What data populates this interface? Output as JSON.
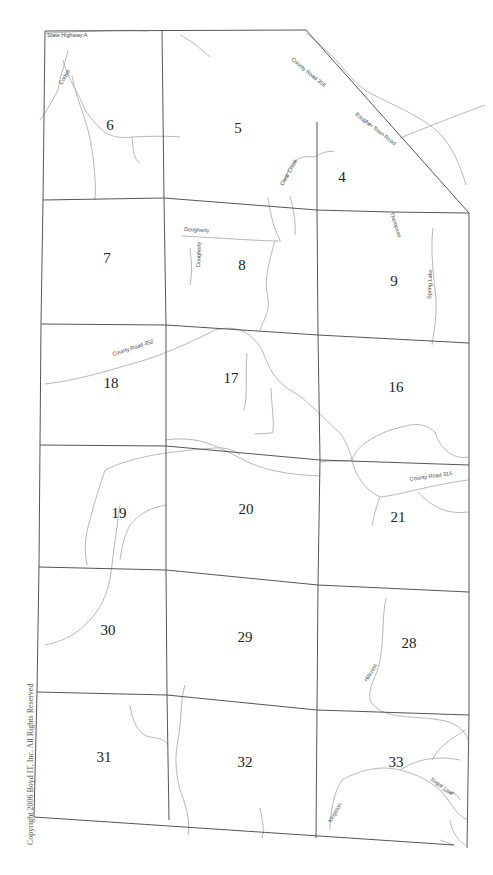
{
  "map": {
    "copyright": "Copyright 2006 Boyd IT, Inc. All Rights Reserved",
    "colors": {
      "grid": "#555555",
      "road": "#b8b8b8",
      "text": "#222222",
      "background": "#ffffff"
    },
    "sections": [
      {
        "id": "6",
        "x": 110,
        "y": 130
      },
      {
        "id": "5",
        "x": 238,
        "y": 133
      },
      {
        "id": "4",
        "x": 342,
        "y": 182
      },
      {
        "id": "7",
        "x": 107,
        "y": 263
      },
      {
        "id": "8",
        "x": 242,
        "y": 270
      },
      {
        "id": "9",
        "x": 394,
        "y": 286
      },
      {
        "id": "18",
        "x": 111,
        "y": 388
      },
      {
        "id": "17",
        "x": 231,
        "y": 383
      },
      {
        "id": "16",
        "x": 396,
        "y": 392
      },
      {
        "id": "19",
        "x": 119,
        "y": 518
      },
      {
        "id": "20",
        "x": 246,
        "y": 514
      },
      {
        "id": "21",
        "x": 398,
        "y": 522
      },
      {
        "id": "30",
        "x": 108,
        "y": 635
      },
      {
        "id": "29",
        "x": 245,
        "y": 642
      },
      {
        "id": "28",
        "x": 409,
        "y": 648
      },
      {
        "id": "31",
        "x": 104,
        "y": 762
      },
      {
        "id": "32",
        "x": 245,
        "y": 767
      },
      {
        "id": "33",
        "x": 396,
        "y": 767
      }
    ],
    "road_labels": [
      {
        "text": "State Highway A",
        "x": 47,
        "y": 37,
        "rotate": 0
      },
      {
        "text": "Corbie",
        "x": 62,
        "y": 85,
        "rotate": -60
      },
      {
        "text": "County Road 306",
        "x": 291,
        "y": 60,
        "rotate": 40
      },
      {
        "text": "Baugher Town Road",
        "x": 355,
        "y": 115,
        "rotate": 38
      },
      {
        "text": "Clear Creek",
        "x": 283,
        "y": 186,
        "rotate": -60
      },
      {
        "text": "Thompson",
        "x": 390,
        "y": 213,
        "rotate": 72
      },
      {
        "text": "Dougherty",
        "x": 184,
        "y": 231,
        "rotate": 3
      },
      {
        "text": "Dougherty",
        "x": 200,
        "y": 267,
        "rotate": -88
      },
      {
        "text": "Spring Lake",
        "x": 431,
        "y": 299,
        "rotate": -88
      },
      {
        "text": "County Road 352",
        "x": 113,
        "y": 356,
        "rotate": -18
      },
      {
        "text": "County Road 315",
        "x": 410,
        "y": 481,
        "rotate": -8
      },
      {
        "text": "Hillcrest",
        "x": 367,
        "y": 682,
        "rotate": -58
      },
      {
        "text": "Sugar Loaf",
        "x": 430,
        "y": 780,
        "rotate": 35
      },
      {
        "text": "Kingston",
        "x": 331,
        "y": 823,
        "rotate": -60
      }
    ],
    "grid_lines": [
      "M45,31 L306,30 L469,213",
      "M45,31 L43,200 L41,324 L40,445 L39,567 L37,692 L34,817 L454,845",
      "M162,30 L164,198 L166,325 L166,446 L166,570 L167,695 L169,820",
      "M317,122 L317,210 L318,335 L320,460 L318,585 L317,710 L316,838",
      "M43,200 L164,198 L317,210 L390,212",
      "M390,212 L469,213 L469,343 L469,465 L469,592 L469,715 L467,848",
      "M41,324 L166,325 L318,335 L469,343",
      "M40,445 L166,446 L320,460 L469,465",
      "M39,567 L166,570 L318,585 L469,592",
      "M37,692 L167,695 L317,710 L469,715"
    ],
    "roads": [
      "M45,33 C80,32 120,29 148,31",
      "M68,50 C65,65 60,75 58,90 C50,105 44,115 40,120",
      "M63,60 C68,80 80,95 85,110 C100,130 108,140 132,137 C150,136 170,136 180,137",
      "M72,76 C76,100 88,120 92,150 C95,170 96,190 95,200",
      "M132,137 C133,150 134,160 140,163",
      "M180,35 C190,40 200,48 210,57",
      "M306,33 C318,42 328,52 337,61 C345,70 355,84 368,92 C390,104 420,115 438,132 C452,145 460,165 466,185",
      "M400,138 C425,128 450,118 485,105",
      "M285,180 C290,160 300,155 315,157 C320,153 330,150 334,152",
      "M268,198 C270,210 272,225 280,240",
      "M290,196 C294,210 296,225 295,235",
      "M275,240 C270,260 263,280 268,298 C270,310 264,320 260,330",
      "M182,236 C220,238 260,241 281,241",
      "M190,248 C191,260 193,270 190,285",
      "M433,228 C430,250 434,280 436,300 C437,320 433,335 432,345",
      "M45,384 C80,380 110,370 145,360 C170,352 195,340 215,330",
      "M215,330 C235,325 250,330 262,350 C270,370 275,380 290,390 C305,398 315,410 340,433 C345,440 350,450 352,460",
      "M247,353 C245,375 248,395 244,410",
      "M271,388 C272,410 275,428 272,433 L255,434",
      "M352,460 C355,450 365,440 390,430 C410,425 420,420 435,432 C440,450 455,460 468,457",
      "M352,460 C355,475 365,490 380,497 C400,495 430,485 468,480",
      "M380,497 C375,510 373,520 372,525",
      "M418,492 C430,505 445,515 468,512",
      "M320,462 C330,460 340,462 352,460",
      "M165,440 C200,435 220,448 240,458 C260,470 290,475 320,476",
      "M120,505 C118,520 115,540 112,565 C110,580 108,600 90,620 C80,630 70,640 45,645",
      "M105,470 C100,485 95,500 90,520 C85,535 84,550 87,565",
      "M105,470 C130,458 160,452 215,448 C225,447 235,450 240,455",
      "M166,505 C150,508 140,513 130,525 C125,535 122,545 120,560",
      "M386,598 C382,615 384,640 380,660 C378,675 368,685 370,700 C380,720 410,715 440,720 C455,722 465,730 468,740",
      "M185,685 C180,700 182,720 178,740 C175,755 175,770 180,790 C188,810 190,825 188,835",
      "M130,705 C132,720 138,735 150,737 C160,738 165,740 168,745",
      "M260,808 C262,820 265,830 262,838",
      "M330,830 C330,810 335,790 342,780 C360,770 380,765 400,770 C420,775 430,782 440,790 C450,800 455,815 468,820",
      "M400,770 C415,760 435,755 460,760",
      "M432,760 C440,745 450,740 465,730",
      "M442,790 C450,795 455,790 460,800",
      "M450,820 C452,830 455,838 465,845",
      "M440,840 L454,845"
    ]
  }
}
